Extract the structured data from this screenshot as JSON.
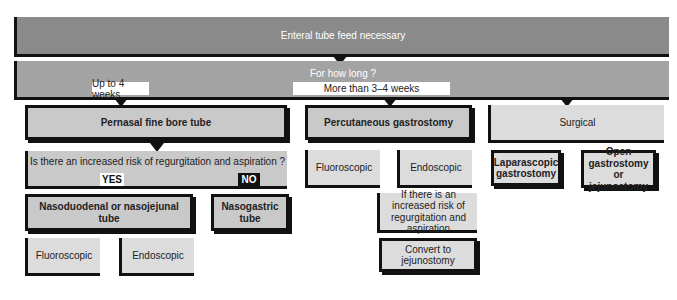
{
  "diagram": {
    "root": "Enteral tube feed necessary",
    "question_duration": "For how long ?",
    "branch_short": "Up to 4 weeks",
    "branch_long": "More than 3–4 weeks",
    "pernasal": "Pernasal fine bore tube",
    "risk_question": "Is there an increased risk of regurgitation and aspiration ?",
    "yes_label": "YES",
    "no_label": "NO",
    "nasoduodenal": "Nasoduodenal or nasojejunal tube",
    "nasogastric": "Nasogastric tube",
    "naso_fluoro": "Fluoroscopic",
    "naso_endo": "Endoscopic",
    "percutaneous": "Percutaneous gastrostomy",
    "perc_fluoro": "Fluoroscopic",
    "perc_endo": "Endoscopic",
    "perc_risk": "If there is an increased risk of regurgitation and aspiration",
    "convert": "Convert to jejunostomy",
    "surgical": "Surgical",
    "laparoscopic": "Laparascopic gastrostomy",
    "open": "Open gastrostomy or jejunostomy"
  }
}
